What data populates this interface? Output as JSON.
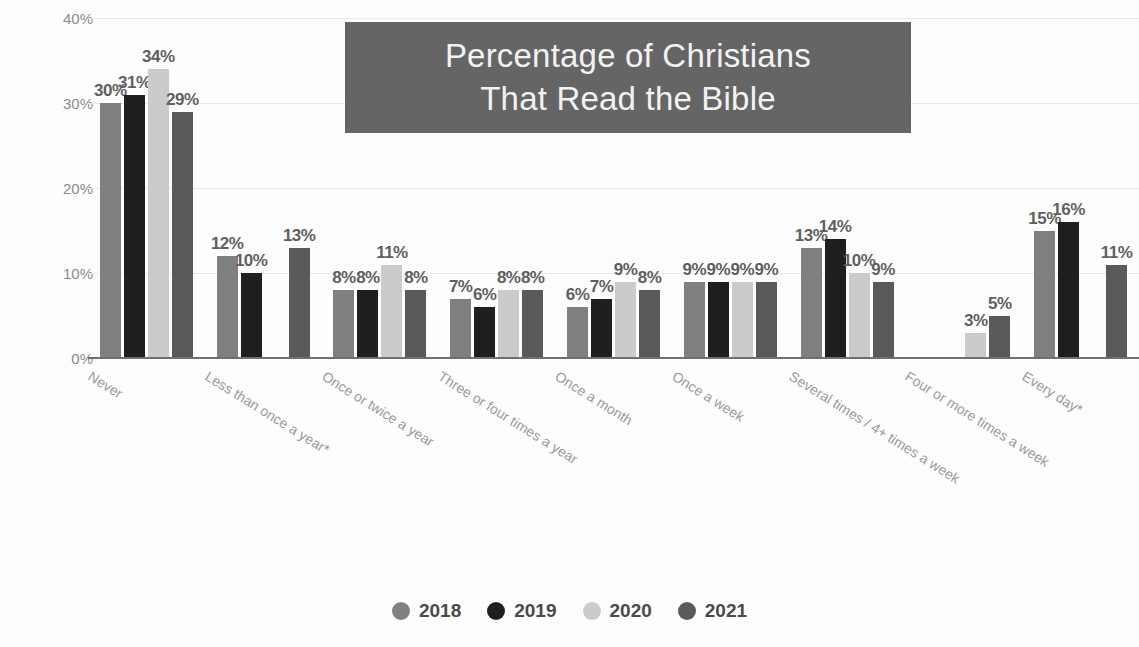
{
  "title": {
    "line1": "Percentage of Christians",
    "line2": "That Read the Bible",
    "box_color": "#656565",
    "text_color": "#f2f2f2"
  },
  "axis": {
    "ylabel": "Share of resondents",
    "yticks": [
      "0%",
      "10%",
      "20%",
      "30%",
      "40%"
    ]
  },
  "legend": {
    "items": [
      {
        "label": "2018",
        "color": "#808080"
      },
      {
        "label": "2019",
        "color": "#1f1f1f"
      },
      {
        "label": "2020",
        "color": "#cbcbcb"
      },
      {
        "label": "2021",
        "color": "#5a5a5a"
      }
    ]
  },
  "chart_data": {
    "type": "bar",
    "title": "Percentage of Christians That Read the Bible",
    "xlabel": "",
    "ylabel": "Share of resondents",
    "ylim": [
      0,
      40
    ],
    "yunit": "%",
    "grid": true,
    "legend_position": "bottom",
    "categories": [
      "Never",
      "Less than once a year*",
      "Once or twice a year",
      "Three or four times a year",
      "Once a month",
      "Once a week",
      "Several times / 4+ times a week",
      "Four or more times a week",
      "Every day*"
    ],
    "series": [
      {
        "name": "2018",
        "color": "#808080",
        "values": [
          30,
          12,
          8,
          7,
          6,
          9,
          13,
          null,
          15
        ]
      },
      {
        "name": "2019",
        "color": "#1f1f1f",
        "values": [
          31,
          10,
          8,
          6,
          7,
          9,
          14,
          null,
          16
        ]
      },
      {
        "name": "2020",
        "color": "#cbcbcb",
        "values": [
          34,
          null,
          11,
          8,
          9,
          9,
          10,
          3,
          null
        ]
      },
      {
        "name": "2021",
        "color": "#5a5a5a",
        "values": [
          29,
          13,
          8,
          8,
          8,
          9,
          9,
          5,
          11
        ]
      }
    ],
    "data_labels": [
      [
        "30%",
        "31%",
        "34%",
        "29%"
      ],
      [
        "12%",
        "10%",
        null,
        "13%"
      ],
      [
        "8%",
        "8%",
        "11%",
        "8%"
      ],
      [
        "7%",
        "6%",
        "8%",
        "8%"
      ],
      [
        "6%",
        "7%",
        "9%",
        "8%"
      ],
      [
        "9%",
        "9%",
        "9%",
        "9%"
      ],
      [
        "13%",
        "14%",
        "10%",
        "9%"
      ],
      [
        null,
        null,
        "3%",
        "5%"
      ],
      [
        "15%",
        "16%",
        null,
        "11%"
      ]
    ]
  }
}
